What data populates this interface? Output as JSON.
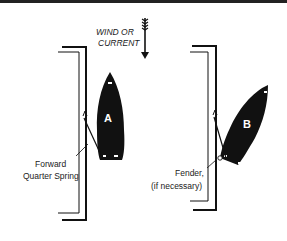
{
  "figure": {
    "wind_label_line1": "WIND OR",
    "wind_label_line2": "CURRENT",
    "boat_a_label": "A",
    "boat_b_label": "B",
    "spring_label_line1": "Forward",
    "spring_label_line2": "Quarter Spring",
    "fender_label_line1": "Fender,",
    "fender_label_line2": "(if necessary)",
    "colors": {
      "ink": "#111111",
      "background": "#ffffff"
    }
  }
}
